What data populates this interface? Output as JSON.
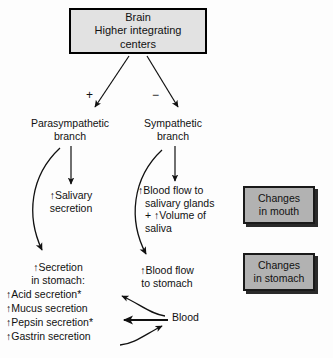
{
  "diagram": {
    "background_color": "#fdfdfd",
    "ink_color": "#111111",
    "box_fill_light": "#e2e2e2",
    "box_fill_grey": "#b2b2b2"
  },
  "brain": {
    "line1": "Brain",
    "line2": "Higher integrating",
    "line3": "centers"
  },
  "signs": {
    "plus": "+",
    "minus": "−"
  },
  "branches": {
    "parasympathetic": {
      "line1": "Parasympathetic",
      "line2": "branch"
    },
    "sympathetic": {
      "line1": "Sympathetic",
      "line2": "branch"
    }
  },
  "effects": {
    "salivary_secretion": {
      "line1": "↑Salivary",
      "line2": "secretion"
    },
    "blood_flow_salivary": {
      "line1": "↑Blood flow to",
      "line2": "salivary glands",
      "line3": "+ ↑Volume of",
      "line4": "saliva"
    },
    "blood_flow_stomach": {
      "line1": "↑Blood flow",
      "line2": "to stomach"
    },
    "secretion_heading": {
      "line1": "↑Secretion",
      "line2": "in stomach:"
    },
    "secretion_items": [
      "↑Acid secretion*",
      "↑Mucus secretion",
      "↑Pepsin secretion*",
      "↑Gastrin secretion"
    ],
    "blood_label": "Blood"
  },
  "outcomes": {
    "mouth": {
      "line1": "Changes",
      "line2": "in mouth"
    },
    "stomach": {
      "line1": "Changes",
      "line2": "in stomach"
    }
  }
}
